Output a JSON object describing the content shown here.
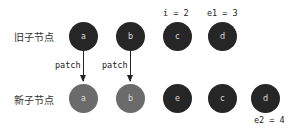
{
  "labels": {
    "old_children": "旧子节点",
    "new_children": "新子节点"
  },
  "old_nodes": [
    {
      "key": "a",
      "color": "#262626"
    },
    {
      "key": "b",
      "color": "#262626"
    },
    {
      "key": "c",
      "color": "#262626"
    },
    {
      "key": "d",
      "color": "#262626"
    }
  ],
  "new_nodes": [
    {
      "key": "a",
      "color": "#6b6b6b"
    },
    {
      "key": "b",
      "color": "#6b6b6b"
    },
    {
      "key": "e",
      "color": "#262626"
    },
    {
      "key": "c",
      "color": "#262626"
    },
    {
      "key": "d",
      "color": "#262626"
    }
  ],
  "pointers": {
    "i": "i = 2",
    "e1": "e1 = 3",
    "e2": "e2 = 4"
  },
  "arrows": [
    {
      "label": "patch"
    },
    {
      "label": "patch"
    }
  ]
}
